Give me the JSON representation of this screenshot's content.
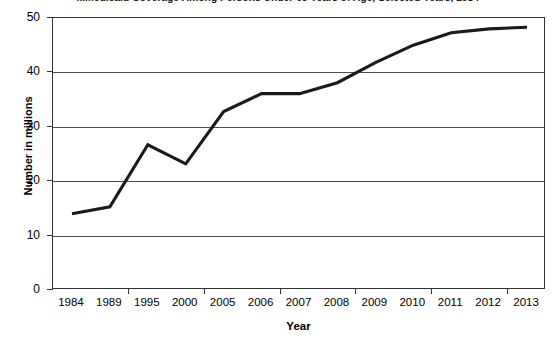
{
  "chart_data": {
    "type": "line",
    "title": "...Medicaid Coverage Among Persons Under 65 Years of Age, Selected Years, 1984-",
    "xlabel": "Year",
    "ylabel": "Number in millions",
    "categories": [
      "1984",
      "1989",
      "1995",
      "2000",
      "2005",
      "2006",
      "2007",
      "2008",
      "2009",
      "2010",
      "2011",
      "2012",
      "2013"
    ],
    "values": [
      14.0,
      15.3,
      26.7,
      23.2,
      32.8,
      36.1,
      36.1,
      38.1,
      41.8,
      45.0,
      47.3,
      48.0,
      48.3
    ],
    "series": [
      {
        "name": "Medicaid coverage",
        "values": [
          14.0,
          15.3,
          26.7,
          23.2,
          32.8,
          36.1,
          36.1,
          38.1,
          41.8,
          45.0,
          47.3,
          48.0,
          48.3
        ]
      }
    ],
    "ylim": [
      0,
      50
    ],
    "yticks": [
      0,
      10,
      20,
      30,
      40,
      50
    ],
    "ytick_labels": [
      "0",
      "10",
      "20",
      "30",
      "40",
      "50"
    ],
    "grid": "horizontal",
    "legend": "none",
    "line_color": "#1a1a1a"
  }
}
